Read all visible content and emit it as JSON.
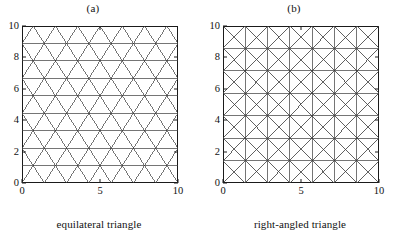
{
  "figure": {
    "background": "#ffffff",
    "line_color": "#3a3a3a",
    "axis_color": "#1a1a1a",
    "width": 405,
    "height": 237
  },
  "panels": [
    {
      "id": "panel-a",
      "title": "(a)",
      "caption": "equilateral triangle",
      "mesh_type": "equilateral"
    },
    {
      "id": "panel-b",
      "title": "(b)",
      "caption": "right-angled triangle",
      "mesh_type": "right-angled"
    }
  ],
  "chart_data": [
    {
      "type": "line",
      "title": "(a)",
      "subtitle": "equilateral triangle",
      "xlabel": "",
      "ylabel": "",
      "xlim": [
        0,
        10
      ],
      "ylim": [
        0,
        10
      ],
      "xticks": [
        0,
        5,
        10
      ],
      "xticklabels": [
        "0",
        "5",
        "10"
      ],
      "yticks": [
        0,
        2,
        4,
        6,
        8,
        10
      ],
      "yticklabels": [
        "0",
        "2",
        "4",
        "6",
        "8",
        "10"
      ],
      "grid": false,
      "legend": "none",
      "mesh": {
        "kind": "equilateral-triangle-mesh",
        "description": "Unstructured triangular mesh of equilateral triangles filling the unit square domain 0-10 by 0-10; horizontal rows plus two diagonal line families at +/-60 degrees.",
        "rows": 9,
        "columns": 7,
        "row_spacing": 1.21,
        "column_spacing": 1.43,
        "node_count": 79,
        "element_count": 126
      }
    },
    {
      "type": "line",
      "title": "(b)",
      "subtitle": "right-angled triangle",
      "xlabel": "",
      "ylabel": "",
      "xlim": [
        0,
        10
      ],
      "ylim": [
        0,
        10
      ],
      "xticks": [
        0,
        5,
        10
      ],
      "xticklabels": [
        "0",
        "5",
        "10"
      ],
      "yticks": [
        0,
        2,
        4,
        6,
        8,
        10
      ],
      "yticklabels": [
        "0",
        "2",
        "4",
        "6",
        "8",
        "10"
      ],
      "grid": true,
      "legend": "none",
      "mesh": {
        "kind": "right-angled-triangle-mesh",
        "description": "Structured square grid over the domain 0-10 by 0-10 with both diagonals drawn in every cell, producing right-angled triangles.",
        "rows": 7,
        "columns": 7,
        "row_spacing": 1.333,
        "column_spacing": 1.333,
        "node_count": 113,
        "element_count": 196
      }
    }
  ]
}
